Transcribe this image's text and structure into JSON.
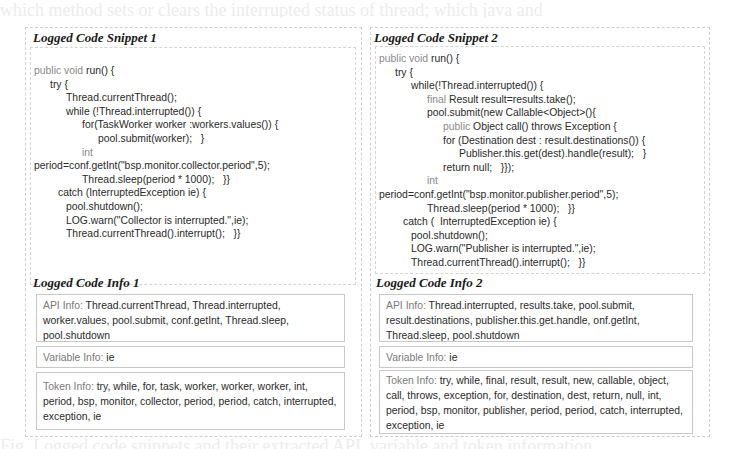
{
  "background_text": {
    "top": "which method sets or clears the interrupted status of thread; which java and",
    "bottom": "Fig. Logged code snippets and their extracted API, variable and token information"
  },
  "snippet1": {
    "title": "Logged Code Snippet 1",
    "lines": [
      {
        "indent": 0,
        "kw": "public void ",
        "text": "run() {"
      },
      {
        "indent": 1,
        "kw": "",
        "text": "try {"
      },
      {
        "indent": 2,
        "kw": "",
        "text": "Thread.currentThread();"
      },
      {
        "indent": 2,
        "kw": "",
        "text": "while (!Thread.interrupted()) {"
      },
      {
        "indent": 3,
        "kw": "",
        "text": "for(TaskWorker worker :workers.values()) {"
      },
      {
        "indent": 4,
        "kw": "",
        "text": "pool.submit(worker);   }"
      },
      {
        "indent": 3,
        "kw": "int",
        "text": ""
      },
      {
        "indent": 0,
        "kw": "",
        "text": "period=conf.getInt(\"bsp.monitor.collector.period\",5);"
      },
      {
        "indent": 3,
        "kw": "",
        "text": "Thread.sleep(period * 1000);   }}"
      },
      {
        "indent": 1.5,
        "kw": "",
        "text": "catch (InterruptedException ie) {"
      },
      {
        "indent": 2,
        "kw": "",
        "text": "pool.shutdown();"
      },
      {
        "indent": 2,
        "kw": "",
        "text": "LOG.warn(\"Collector is interrupted.\",ie);"
      },
      {
        "indent": 2,
        "kw": "",
        "text": "Thread.currentThread().interrupt();   }}"
      }
    ]
  },
  "snippet2": {
    "title": "Logged Code Snippet 2",
    "lines": [
      {
        "indent": 0,
        "kw": "public void ",
        "text": "run() {"
      },
      {
        "indent": 1,
        "kw": "",
        "text": "try {"
      },
      {
        "indent": 2,
        "kw": "",
        "text": "while(!Thread.interrupted()) {"
      },
      {
        "indent": 3,
        "kw": "final ",
        "text": "Result result=results.take();"
      },
      {
        "indent": 3,
        "kw": "",
        "text": "pool.submit(new Callable<Object>(){"
      },
      {
        "indent": 4,
        "kw": "public ",
        "text": "Object call() throws Exception {"
      },
      {
        "indent": 4,
        "kw": "",
        "text": "for (Destination dest : result.destinations()) {"
      },
      {
        "indent": 5,
        "kw": "",
        "text": "Publisher.this.get(dest).handle(result);   }"
      },
      {
        "indent": 4,
        "kw": "",
        "text": "return null;   }});"
      },
      {
        "indent": 3,
        "kw": "int",
        "text": ""
      },
      {
        "indent": 0,
        "kw": "",
        "text": "period=conf.getInt(\"bsp.monitor.publisher.period\",5);"
      },
      {
        "indent": 3,
        "kw": "",
        "text": "Thread.sleep(period * 1000);   }}"
      },
      {
        "indent": 1.5,
        "kw": "",
        "text": "catch (  InterruptedException ie) {"
      },
      {
        "indent": 2,
        "kw": "",
        "text": "pool.shutdown();"
      },
      {
        "indent": 2,
        "kw": "",
        "text": "LOG.warn(\"Publisher is interrupted.\",ie);"
      },
      {
        "indent": 2,
        "kw": "",
        "text": "Thread.currentThread().interrupt();   }}"
      }
    ]
  },
  "info1": {
    "title": "Logged Code Info 1",
    "api_label": "API Info: ",
    "api_value": "Thread.currentThread, Thread.interrupted, worker.values, pool.submit, conf.getInt, Thread.sleep, pool.shutdown",
    "var_label": "Variable Info: ",
    "var_value": "ie",
    "token_label": "Token Info: ",
    "token_value": "try, while, for, task, worker, worker, worker, int, period, bsp, monitor, collector, period, period, catch, interrupted, exception, ie"
  },
  "info2": {
    "title": "Logged Code Info 2",
    "api_label": "API Info: ",
    "api_value": "Thread.interrupted, results.take, pool.submit, result.destinations, publisher.this.get.handle, onf.getInt, Thread.sleep, pool.shutdown",
    "var_label": "Variable Info: ",
    "var_value": "ie",
    "token_label": "Token Info: ",
    "token_value": "try, while, final, result, result, new, callable, object, call, throws, exception, for, destination, dest, return, null, int, period, bsp, monitor, publisher, period, period, catch, interrupted, exception, ie"
  }
}
